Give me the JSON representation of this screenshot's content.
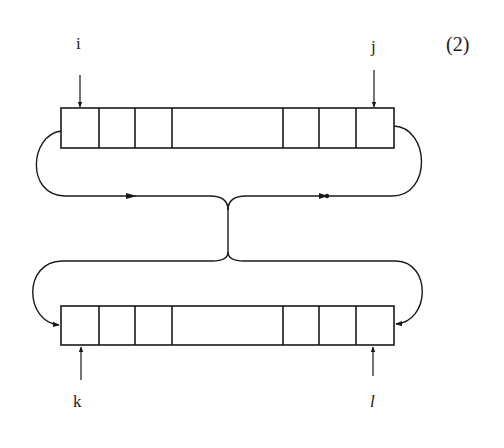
{
  "figure": {
    "equation_number": "(2)",
    "pointers": {
      "top_left": "i",
      "top_right": "j",
      "bottom_left": "k",
      "bottom_right": "l"
    },
    "buffers": [
      {
        "name": "top-buffer",
        "cells_left": 3,
        "cells_right": 3,
        "has_gap_segment": true
      },
      {
        "name": "bottom-buffer",
        "cells_left": 3,
        "cells_right": 3,
        "has_gap_segment": true
      }
    ],
    "colors": {
      "stroke": "#1a1a1a",
      "background": "#ffffff"
    }
  }
}
